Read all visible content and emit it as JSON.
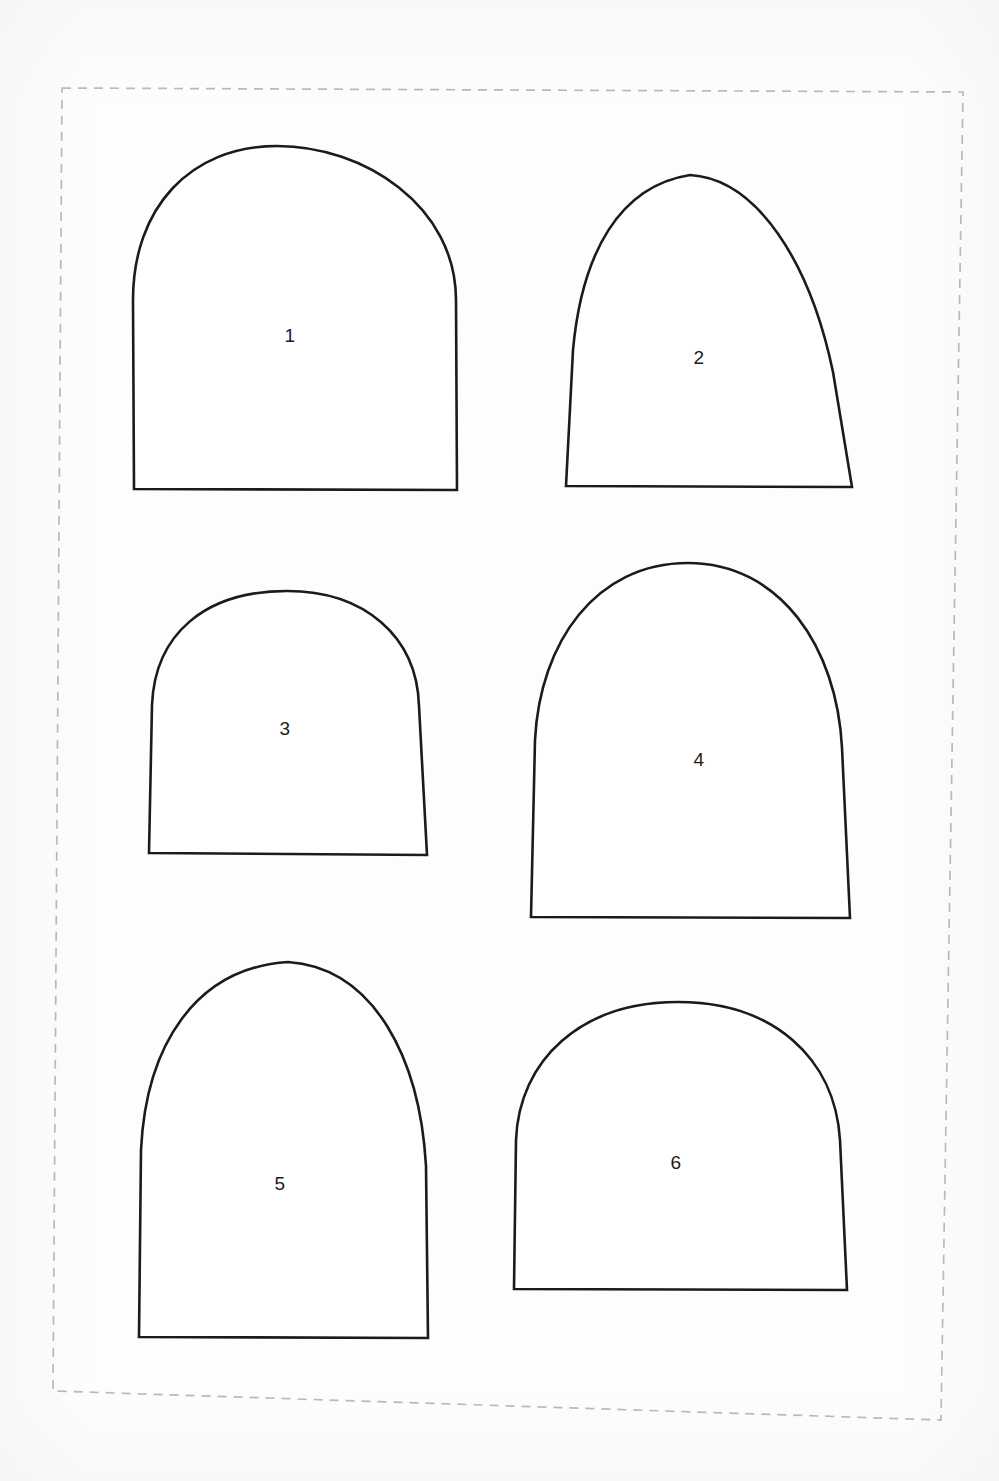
{
  "document": {
    "type": "pattern-template-sheet",
    "title": "Arch Shape Template Sheet",
    "background_color": "#fdfdfd",
    "outline_color": "#1b1b1b",
    "frame": {
      "name": "dashed-cut-border",
      "color": "#b9b9bd",
      "style": "dashed",
      "corners": {
        "top_left": {
          "x": 62,
          "y": 88
        },
        "top_right": {
          "x": 963,
          "y": 92
        },
        "bottom_right": {
          "x": 941,
          "y": 1420
        },
        "bottom_left": {
          "x": 53,
          "y": 1391
        }
      }
    }
  },
  "shapes": [
    {
      "label": "1",
      "arch_type": "round-topped arch",
      "label_x": 290,
      "label_y": 335,
      "base_left_x": 133,
      "base_right_x": 457,
      "base_y": 491,
      "apex_x": 277,
      "apex_y": 146,
      "width": 324,
      "height": 345,
      "path": "M 134 489 L 133 300 C 133 208 190 146 277 146 C 364 146 456 206 456 300 L 457 490 Z"
    },
    {
      "label": "2",
      "arch_type": "pointed gothic arch",
      "label_x": 699,
      "label_y": 357,
      "base_left_x": 564,
      "base_right_x": 853,
      "base_y": 487,
      "apex_x": 690,
      "apex_y": 175,
      "width": 289,
      "height": 312,
      "path": "M 566 486 L 573 350 C 582 252 620 186 690 175 C 757 179 810 262 833 372 L 852 487 Z"
    },
    {
      "label": "3",
      "arch_type": "round arch",
      "label_x": 285,
      "label_y": 728,
      "base_left_x": 148,
      "base_right_x": 428,
      "base_y": 855,
      "apex_x": 287,
      "apex_y": 591,
      "width": 280,
      "height": 264,
      "path": "M 149 853 L 152 705 C 155 634 205 591 287 591 C 364 591 417 636 419 706 L 427 855 Z"
    },
    {
      "label": "4",
      "arch_type": "tall parabolic arch",
      "label_x": 699,
      "label_y": 759,
      "base_left_x": 530,
      "base_right_x": 851,
      "base_y": 918,
      "apex_x": 688,
      "apex_y": 563,
      "width": 321,
      "height": 355,
      "path": "M 531 917 L 535 740 C 540 642 596 563 688 563 C 780 563 837 647 842 748 L 850 918 Z"
    },
    {
      "label": "5",
      "arch_type": "pointed gothic arch",
      "label_x": 280,
      "label_y": 1183,
      "base_left_x": 138,
      "base_right_x": 428,
      "base_y": 1338,
      "apex_x": 288,
      "apex_y": 962,
      "width": 290,
      "height": 376,
      "path": "M 139 1337 L 141 1150 C 146 1046 195 968 288 962 C 375 968 420 1060 426 1166 L 428 1338 Z"
    },
    {
      "label": "6",
      "arch_type": "semicircular round arch",
      "label_x": 676,
      "label_y": 1162,
      "base_left_x": 513,
      "base_right_x": 848,
      "base_y": 1290,
      "apex_x": 678,
      "apex_y": 1002,
      "width": 335,
      "height": 288,
      "path": "M 514 1289 L 516 1140 C 519 1060 581 1002 678 1002 C 773 1002 835 1058 840 1140 L 847 1290 Z"
    }
  ]
}
